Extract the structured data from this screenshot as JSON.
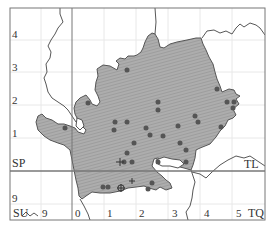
{
  "map": {
    "grid_squares": [
      {
        "code": "SP",
        "position": "top-left"
      },
      {
        "code": "TL",
        "position": "top-right"
      },
      {
        "code": "SU",
        "position": "bottom-left"
      },
      {
        "code": "TQ",
        "position": "bottom-right"
      }
    ],
    "y_axis_labels": [
      "4",
      "3",
      "2",
      "1",
      "9"
    ],
    "x_axis_labels": [
      "9",
      "0",
      "1",
      "2",
      "3",
      "4",
      "5"
    ],
    "labels": {
      "sp": "SP",
      "tl": "TL",
      "su": "SU",
      "tq": "TQ",
      "y4": "4",
      "y3": "3",
      "y2": "2",
      "y1": "1",
      "y9": "9",
      "x9": "9",
      "x0": "0",
      "x1": "1",
      "x2": "2",
      "x3": "3",
      "x4": "4",
      "x5": "5"
    },
    "colors": {
      "region_fill": "#a8a8a8",
      "hatch": "#8f8f8f",
      "outline": "#555555",
      "dot": "#555555",
      "grid_major": "#777777",
      "grid_minor": "#e6e6e6",
      "river": "#444444"
    },
    "legend_symbols": {
      "dot": "record-present",
      "cross": "record-old",
      "circled-cross": "record-other"
    },
    "dots": [
      [
        127,
        70
      ],
      [
        188,
        92
      ],
      [
        229,
        91
      ],
      [
        236,
        95
      ],
      [
        158,
        102
      ],
      [
        158,
        112
      ],
      [
        113,
        104
      ],
      [
        66,
        128
      ],
      [
        115,
        122
      ],
      [
        127,
        122
      ],
      [
        150,
        126
      ],
      [
        178,
        127
      ],
      [
        207,
        116
      ],
      [
        236,
        105
      ],
      [
        232,
        103
      ],
      [
        234,
        112
      ],
      [
        115,
        130
      ],
      [
        199,
        129
      ],
      [
        223,
        128
      ],
      [
        107,
        132
      ],
      [
        185,
        136
      ],
      [
        114,
        151
      ],
      [
        144,
        153
      ],
      [
        127,
        144
      ],
      [
        139,
        158
      ],
      [
        193,
        153
      ],
      [
        205,
        143
      ],
      [
        104,
        155
      ],
      [
        160,
        160
      ],
      [
        193,
        140
      ],
      [
        203,
        156
      ],
      [
        123,
        156
      ],
      [
        152,
        173
      ],
      [
        102,
        187
      ],
      [
        108,
        187
      ],
      [
        148,
        182
      ],
      [
        160,
        191
      ]
    ],
    "crosses": [
      [
        120,
        162
      ],
      [
        132,
        181
      ]
    ],
    "circled_crosses": [
      [
        121,
        188
      ]
    ]
  }
}
